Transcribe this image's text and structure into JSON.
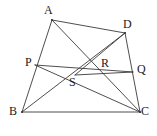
{
  "figure": {
    "kind": "geometry-diagram",
    "width": 157,
    "height": 136,
    "background_color": "#ffffff",
    "stroke_color": "#3a3a3a",
    "stroke_width": 0.9,
    "label_color": "#1a1a1a"
  },
  "points": {
    "A": {
      "label": "A",
      "x": 52,
      "y": 20,
      "label_x": 44,
      "label_y": 4
    },
    "D": {
      "label": "D",
      "x": 125,
      "y": 33,
      "label_x": 123,
      "label_y": 18
    },
    "P": {
      "label": "P",
      "x": 35,
      "y": 65,
      "label_x": 25,
      "label_y": 56
    },
    "R": {
      "label": "R",
      "x": 95,
      "y": 65,
      "label_x": 101,
      "label_y": 57
    },
    "Q": {
      "label": "Q",
      "x": 133,
      "y": 72,
      "label_x": 137,
      "label_y": 63
    },
    "S": {
      "label": "S",
      "x": 75,
      "y": 75,
      "label_x": 69,
      "label_y": 76
    },
    "B": {
      "label": "B",
      "x": 22,
      "y": 112,
      "label_x": 9,
      "label_y": 105
    },
    "C": {
      "label": "C",
      "x": 140,
      "y": 112,
      "label_x": 141,
      "label_y": 105
    }
  },
  "segments": [
    {
      "name": "side-AD",
      "from": "A",
      "to": "D"
    },
    {
      "name": "side-AB",
      "from": "A",
      "to": "B"
    },
    {
      "name": "side-BC",
      "from": "B",
      "to": "C"
    },
    {
      "name": "side-DC",
      "from": "D",
      "to": "C"
    },
    {
      "name": "diagonal-AC",
      "from": "A",
      "to": "C"
    },
    {
      "name": "diagonal-BD",
      "from": "B",
      "to": "D"
    },
    {
      "name": "segment-PQ",
      "from": "P",
      "to": "Q"
    },
    {
      "name": "segment-PC",
      "from": "P",
      "to": "C"
    },
    {
      "name": "segment-DS",
      "from": "D",
      "to": "S"
    },
    {
      "name": "segment-SQ",
      "from": "S",
      "to": "Q"
    }
  ],
  "labels_order": [
    "A",
    "D",
    "P",
    "R",
    "Q",
    "S",
    "B",
    "C"
  ]
}
